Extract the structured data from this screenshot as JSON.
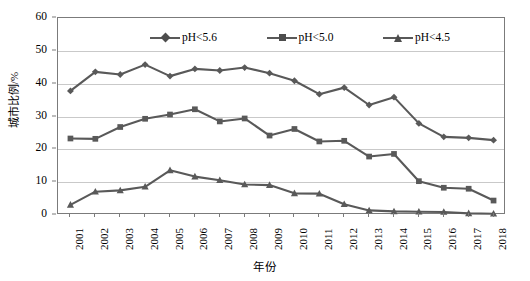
{
  "chart_data": {
    "type": "line",
    "title": "",
    "xlabel": "年份",
    "ylabel": "城市比例/%",
    "ylim": [
      0,
      60
    ],
    "ytick_values": [
      0,
      10,
      20,
      30,
      40,
      50,
      60
    ],
    "ytick_labels": [
      "0",
      "10",
      "20",
      "30",
      "40",
      "50",
      "60"
    ],
    "grid": true,
    "legend_position": "top-inside",
    "categories": [
      "2001",
      "2002",
      "2003",
      "2004",
      "2005",
      "2006",
      "2007",
      "2008",
      "2009",
      "2010",
      "2011",
      "2012",
      "2013",
      "2014",
      "2015",
      "2016",
      "2017",
      "2018"
    ],
    "x": [
      "2001",
      "2002",
      "2003",
      "2004",
      "2005",
      "2006",
      "2007",
      "2008",
      "2009",
      "2010",
      "2011",
      "2012",
      "2013",
      "2014",
      "2015",
      "2016",
      "2017",
      "2018"
    ],
    "series": [
      {
        "name": "pH<5.6",
        "marker": "diamond",
        "color": "#595959",
        "values": [
          37.8,
          43.6,
          42.8,
          45.8,
          42.3,
          44.5,
          44.0,
          44.9,
          43.2,
          40.9,
          36.8,
          38.8,
          33.5,
          35.9,
          27.9,
          23.8,
          23.5,
          22.8
        ]
      },
      {
        "name": "pH<5.0",
        "marker": "square",
        "color": "#595959",
        "values": [
          23.3,
          23.2,
          26.8,
          29.3,
          30.6,
          32.2,
          28.5,
          29.4,
          24.2,
          26.2,
          22.4,
          22.6,
          17.8,
          18.6,
          10.3,
          8.3,
          8.0,
          4.4
        ]
      },
      {
        "name": "pH<4.5",
        "marker": "triangle",
        "color": "#595959",
        "values": [
          3.1,
          7.1,
          7.5,
          8.6,
          13.6,
          11.7,
          10.6,
          9.3,
          9.1,
          6.6,
          6.5,
          3.3,
          1.4,
          1.1,
          1.0,
          0.9,
          0.5,
          0.4
        ]
      }
    ]
  },
  "legend": {
    "items": [
      {
        "label": "pH<5.6",
        "marker": "diamond"
      },
      {
        "label": "pH<5.0",
        "marker": "square"
      },
      {
        "label": "pH<4.5",
        "marker": "triangle"
      }
    ]
  },
  "axes": {
    "y_title": "城市比例/%",
    "x_title": "年份"
  }
}
